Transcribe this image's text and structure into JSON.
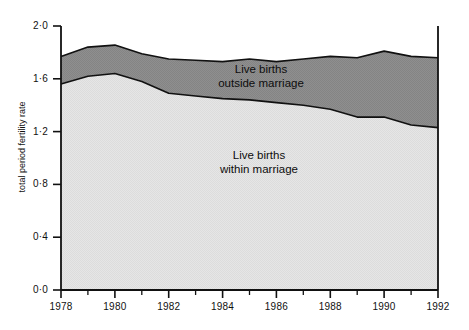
{
  "chart_data": {
    "type": "area",
    "title": "",
    "subtitle": "",
    "xlabel": "",
    "ylabel": "total period fertility rate",
    "stacked": true,
    "grid": false,
    "legend_position": "in-plot-annotations",
    "xlim": [
      1978,
      1992
    ],
    "ylim": [
      0.0,
      2.0
    ],
    "x": [
      1978,
      1979,
      1980,
      1981,
      1982,
      1983,
      1984,
      1985,
      1986,
      1987,
      1988,
      1989,
      1990,
      1991,
      1992
    ],
    "xticks": [
      1978,
      1980,
      1982,
      1984,
      1986,
      1988,
      1990,
      1992
    ],
    "xtick_labels": [
      "1978",
      "1980",
      "1982",
      "1984",
      "1986",
      "1988",
      "1990",
      "1992"
    ],
    "xminor_ticks": [
      1979,
      1981,
      1983,
      1985,
      1987,
      1989,
      1991
    ],
    "yticks": [
      0.0,
      0.4,
      0.8,
      1.2,
      1.6,
      2.0
    ],
    "ytick_labels": [
      "0·0",
      "0·4",
      "0·8",
      "1·2",
      "1·6",
      "2·0"
    ],
    "series": [
      {
        "name": "Live births within marriage",
        "color": "#e2e2e2",
        "values": [
          1.56,
          1.62,
          1.64,
          1.58,
          1.49,
          1.47,
          1.45,
          1.44,
          1.42,
          1.4,
          1.37,
          1.31,
          1.31,
          1.25,
          1.23
        ]
      },
      {
        "name": "Live births outside marriage",
        "color": "#8c8c8c",
        "values": [
          0.21,
          0.22,
          0.21,
          0.21,
          0.26,
          0.27,
          0.28,
          0.31,
          0.31,
          0.35,
          0.4,
          0.45,
          0.5,
          0.52,
          0.53
        ]
      }
    ],
    "totals": [
      1.77,
      1.84,
      1.855,
      1.79,
      1.75,
      1.74,
      1.73,
      1.75,
      1.73,
      1.75,
      1.77,
      1.76,
      1.81,
      1.77,
      1.76
    ],
    "annotations": [
      {
        "id": "outside",
        "line1": "Live births",
        "line2": "outside marriage"
      },
      {
        "id": "within",
        "line1": "Live births",
        "line2": "within marriage"
      }
    ],
    "colors": {
      "within_marriage": "#e2e2e2",
      "outside_marriage": "#8c8c8c",
      "axis": "#111111",
      "outline": "#111111",
      "background": "#ffffff"
    }
  },
  "axes": {
    "y_title": "total period fertility rate",
    "y_labels": [
      "2·0",
      "1·6",
      "1·2",
      "0·8",
      "0·4",
      "0·0"
    ],
    "x_labels": [
      "1978",
      "1980",
      "1982",
      "1984",
      "1986",
      "1988",
      "1990",
      "1992"
    ]
  },
  "labels": {
    "outside_line1": "Live births",
    "outside_line2": "outside marriage",
    "within_line1": "Live births",
    "within_line2": "within marriage"
  }
}
